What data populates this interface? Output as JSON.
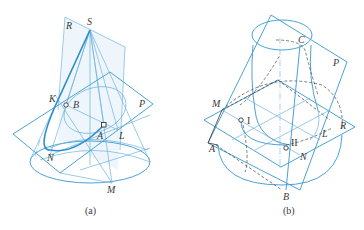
{
  "figures": [
    {
      "caption": "(a)",
      "points": {
        "S": "S",
        "R": "R",
        "K": "K",
        "B": "B",
        "P": "P",
        "A": "A",
        "L": "L",
        "N": "N",
        "M": "M"
      }
    },
    {
      "caption": "(b)",
      "points": {
        "C": "C",
        "P": "P",
        "M": "M",
        "I": "I",
        "R": "R",
        "L": "L",
        "II": "II",
        "N": "N",
        "A": "A",
        "B": "B"
      }
    }
  ],
  "colors": {
    "line_blue": "#4aa3d6",
    "dark_blue": "#2f8fcc",
    "light_blue": "#6fb3dc",
    "text": "#3a3a3a"
  }
}
